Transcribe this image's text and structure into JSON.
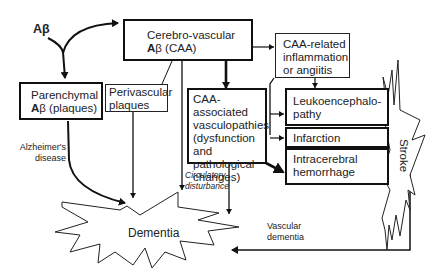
{
  "diagram": {
    "root": {
      "label": "Aβ"
    },
    "nodes": {
      "cerebrovascular": {
        "line1": "Cerebro-vascular",
        "line2_bold": "A",
        "line2_rest": "β (CAA)"
      },
      "parenchymal": {
        "line1": "Parenchymal",
        "line2_bold": "A",
        "line2_rest": "β (plaques)"
      },
      "perivascular": {
        "line1": "Perivascular",
        "line2": "plaques"
      },
      "caa_inflammation": {
        "line1": "CAA-related",
        "line2": "inflammation",
        "line3": "or angiitis"
      },
      "caa_vasculopathies": {
        "line1": "CAA-",
        "line2": "associated",
        "line3": "vasculopathies",
        "line4": "(dysfunction",
        "line5": "and pathological",
        "line6": "changes)"
      },
      "leukoencephalopathy": {
        "line1": "Leukoencephalo-",
        "line2": "pathy"
      },
      "infarction": {
        "line1": "Infarction"
      },
      "hemorrhage": {
        "line1": "Intracerebral",
        "line2": "hemorrhage"
      },
      "dementia": {
        "label": "Dementia"
      },
      "stroke": {
        "label": "Stroke"
      }
    },
    "edge_labels": {
      "alzheimers": {
        "line1": "Alzheimer's",
        "line2": "disease"
      },
      "circulatory": {
        "line1": "Circulatory",
        "line2": "disturbance"
      },
      "vascular_dementia": {
        "line1": "Vascular",
        "line2": "dementia"
      }
    },
    "colors": {
      "line": "#111111",
      "background": "#ffffff"
    }
  }
}
